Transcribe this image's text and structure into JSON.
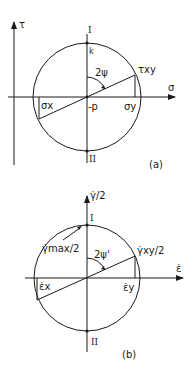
{
  "diagram_a": {
    "caption": "(a)",
    "tau_axis_label": "τ",
    "sigma_axis_label": "σ",
    "top_pole_label": "I",
    "bottom_pole_label": "II",
    "k_label": "k",
    "angle_label": "2ψ",
    "tau_xy_label": "τxy",
    "sigma_x_label": "σx",
    "sigma_y_label": "σy",
    "center_label": "-p"
  },
  "diagram_b": {
    "caption": "(b)",
    "vertical_axis_label": "γ̇/2",
    "horizontal_axis_label": "ε̇",
    "top_pole_label": "I",
    "bottom_pole_label": "II",
    "gamma_max_label": "γ̇max/2",
    "angle_label": "2ψ'",
    "gamma_xy_label": "γ̇xy/2",
    "eps_x_label": "ε̇x",
    "eps_y_label": "ε̇y"
  }
}
